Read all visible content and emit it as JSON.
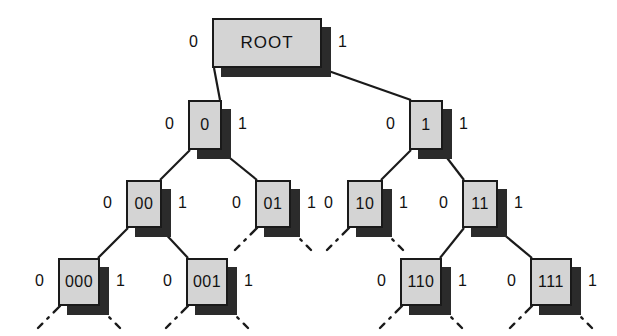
{
  "diagram": {
    "colors": {
      "node_fill": "#d4d4d4",
      "node_border": "#1a1a1a",
      "shadow": "#2b2b2b",
      "edge": "#1a1a1a",
      "background": "#ffffff",
      "text": "#111111"
    },
    "edge_labels": {
      "left": "0",
      "right": "1"
    },
    "nodes": [
      {
        "id": "root",
        "label": "ROOT",
        "level": 0,
        "x": 212,
        "y": 18,
        "w": 110,
        "h": 50,
        "left_label": "0",
        "right_label": "1",
        "children": [
          "0",
          "1"
        ],
        "dotted_children": false
      },
      {
        "id": "0",
        "label": "0",
        "level": 1,
        "x": 188,
        "y": 100,
        "w": 34,
        "h": 50,
        "left_label": "0",
        "right_label": "1",
        "children": [
          "00",
          "01"
        ],
        "dotted_children": false
      },
      {
        "id": "1",
        "label": "1",
        "level": 1,
        "x": 409,
        "y": 100,
        "w": 34,
        "h": 50,
        "left_label": "0",
        "right_label": "1",
        "children": [
          "10",
          "11"
        ],
        "dotted_children": false
      },
      {
        "id": "00",
        "label": "00",
        "level": 2,
        "x": 126,
        "y": 180,
        "w": 36,
        "h": 48,
        "left_label": "0",
        "right_label": "1",
        "children": [
          "000",
          "001"
        ],
        "dotted_children": false
      },
      {
        "id": "01",
        "label": "01",
        "level": 2,
        "x": 255,
        "y": 180,
        "w": 36,
        "h": 48,
        "left_label": "0",
        "right_label": "1",
        "children": [],
        "dotted_children": true
      },
      {
        "id": "10",
        "label": "10",
        "level": 2,
        "x": 347,
        "y": 180,
        "w": 36,
        "h": 48,
        "left_label": "0",
        "right_label": "1",
        "children": [],
        "dotted_children": true
      },
      {
        "id": "11",
        "label": "11",
        "level": 2,
        "x": 462,
        "y": 180,
        "w": 36,
        "h": 48,
        "left_label": "0",
        "right_label": "1",
        "children": [
          "110",
          "111"
        ],
        "dotted_children": false
      },
      {
        "id": "000",
        "label": "000",
        "level": 3,
        "x": 58,
        "y": 258,
        "w": 42,
        "h": 48,
        "left_label": "0",
        "right_label": "1",
        "children": [],
        "dotted_children": true
      },
      {
        "id": "001",
        "label": "001",
        "level": 3,
        "x": 186,
        "y": 258,
        "w": 42,
        "h": 48,
        "left_label": "0",
        "right_label": "1",
        "children": [],
        "dotted_children": true
      },
      {
        "id": "110",
        "label": "110",
        "level": 3,
        "x": 400,
        "y": 258,
        "w": 42,
        "h": 48,
        "left_label": "0",
        "right_label": "1",
        "children": [],
        "dotted_children": true
      },
      {
        "id": "111",
        "label": "111",
        "level": 3,
        "x": 530,
        "y": 258,
        "w": 42,
        "h": 48,
        "left_label": "0",
        "right_label": "1",
        "children": [],
        "dotted_children": true
      }
    ]
  }
}
